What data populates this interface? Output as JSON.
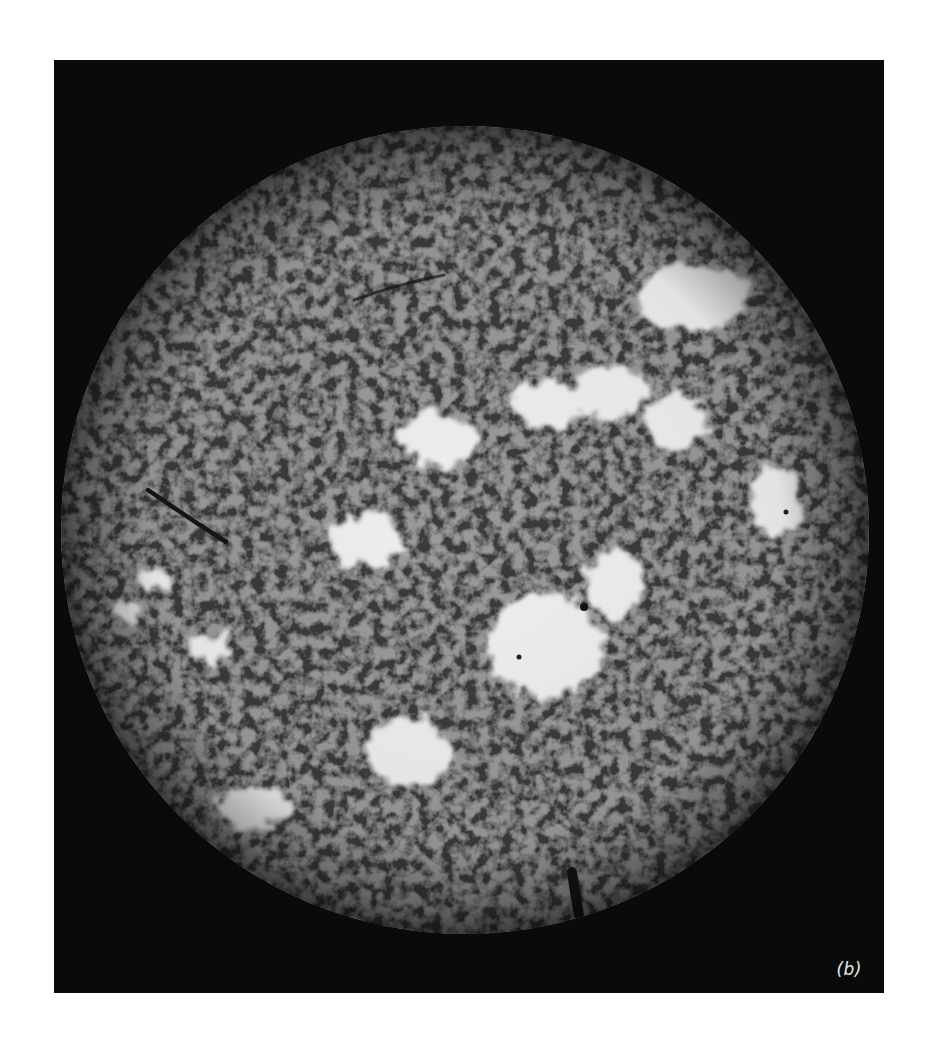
{
  "figure": {
    "panel_label": "(b)",
    "colors": {
      "background_page": "#ffffff",
      "background_panel": "#0b0b0b",
      "disk_base": "#3a3a3a",
      "plage": "#f2f2f2",
      "filament": "#161616"
    },
    "disk": {
      "cx": 411,
      "cy": 470,
      "r": 404
    },
    "plages": [
      {
        "name": "upper-right-plage",
        "cx": 640,
        "cy": 237,
        "rx": 55,
        "ry": 35
      },
      {
        "name": "upper-center-plage-a",
        "cx": 555,
        "cy": 333,
        "rx": 40,
        "ry": 28
      },
      {
        "name": "upper-center-plage-b",
        "cx": 490,
        "cy": 345,
        "rx": 38,
        "ry": 25
      },
      {
        "name": "upper-center-plage-c",
        "cx": 385,
        "cy": 375,
        "rx": 38,
        "ry": 28
      },
      {
        "name": "upper-right-plage-b",
        "cx": 620,
        "cy": 360,
        "rx": 32,
        "ry": 30
      },
      {
        "name": "center-left-plage",
        "cx": 310,
        "cy": 480,
        "rx": 38,
        "ry": 28
      },
      {
        "name": "right-limb-plage",
        "cx": 720,
        "cy": 440,
        "rx": 28,
        "ry": 38
      },
      {
        "name": "central-large-plage",
        "cx": 490,
        "cy": 580,
        "rx": 60,
        "ry": 55
      },
      {
        "name": "central-plage-ext",
        "cx": 560,
        "cy": 520,
        "rx": 30,
        "ry": 35
      },
      {
        "name": "left-limb-plage-a",
        "cx": 100,
        "cy": 520,
        "rx": 18,
        "ry": 14
      },
      {
        "name": "left-limb-plage-b",
        "cx": 75,
        "cy": 550,
        "rx": 14,
        "ry": 12
      },
      {
        "name": "left-plage-c",
        "cx": 155,
        "cy": 585,
        "rx": 22,
        "ry": 14
      },
      {
        "name": "lower-center-plage",
        "cx": 355,
        "cy": 690,
        "rx": 45,
        "ry": 35
      },
      {
        "name": "lower-left-plage",
        "cx": 200,
        "cy": 745,
        "rx": 42,
        "ry": 22
      }
    ],
    "filaments": [
      {
        "name": "left-filament",
        "d": "M94,430 Q130,455 172,482"
      },
      {
        "name": "upper-filament",
        "d": "M300,240 Q340,225 390,215"
      },
      {
        "name": "bottom-limb-filament",
        "d": "M518,812 Q522,840 528,872"
      }
    ]
  }
}
